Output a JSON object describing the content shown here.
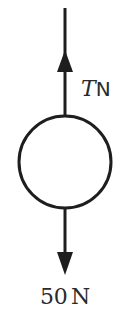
{
  "diagram": {
    "type": "free-body diagram",
    "object": "circle",
    "forces": [
      {
        "direction": "up",
        "label_var": "T",
        "label_unit": "N"
      },
      {
        "direction": "down",
        "label_value": "50",
        "label_unit": "N"
      }
    ],
    "colors": {
      "stroke": "#1e1e1e",
      "background": "#ffffff"
    }
  }
}
